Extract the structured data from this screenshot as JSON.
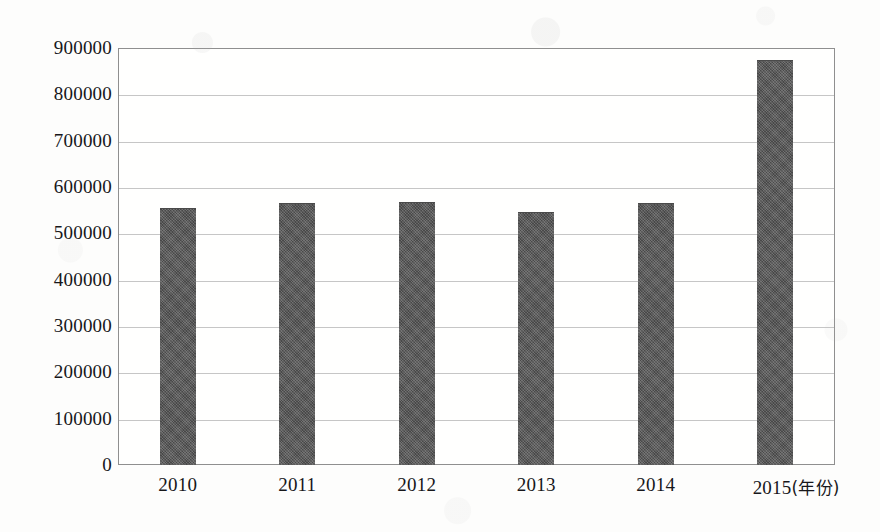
{
  "chart_data": {
    "type": "bar",
    "title": "",
    "subtitle": "",
    "xlabel": "(年份)",
    "ylabel": "",
    "categories": [
      "2010",
      "2011",
      "2012",
      "2013",
      "2014",
      "2015"
    ],
    "values": [
      555000,
      565000,
      567000,
      546000,
      565000,
      874000
    ],
    "series": [
      {
        "name": "",
        "values": [
          555000,
          565000,
          567000,
          546000,
          565000,
          874000
        ]
      }
    ],
    "ylim": [
      0,
      900000
    ],
    "ytick_step": 100000,
    "ytick_labels": [
      "900000",
      "800000",
      "700000",
      "600000",
      "500000",
      "400000",
      "300000",
      "200000",
      "100000",
      "0"
    ],
    "ytick_values": [
      900000,
      800000,
      700000,
      600000,
      500000,
      400000,
      300000,
      200000,
      100000,
      0
    ],
    "xtick_labels": [
      "2010",
      "2011",
      "2012",
      "2013",
      "2014",
      "2015"
    ],
    "x_axis_unit_note": "(年份)",
    "grid": true,
    "grid_axis": "y",
    "legend": false,
    "legend_position": "none",
    "bar_color": "#575757",
    "grid_color": "#c6c6c6",
    "axis_color": "#8f8f8f",
    "background_color": "#fdfdfc",
    "text_color": "#17171a",
    "annotations": []
  }
}
